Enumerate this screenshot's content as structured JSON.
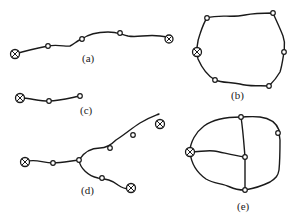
{
  "figure": {
    "width": 297,
    "height": 222,
    "colors": {
      "line": "#1a1a1a",
      "background": "#ffffff",
      "node_fill": "#ffffff"
    },
    "legend_symbols": {
      "source": "circled-x-icon",
      "node": "small-open-circle-icon"
    },
    "subfigures": [
      {
        "id": "a",
        "label": "(a)",
        "topology": "radial line",
        "sources": 2,
        "nodes": 4
      },
      {
        "id": "b",
        "label": "(b)",
        "topology": "ring / loop",
        "sources": 1,
        "nodes": 5
      },
      {
        "id": "c",
        "label": "(c)",
        "topology": "short radial line",
        "sources": 1,
        "nodes": 2
      },
      {
        "id": "d",
        "label": "(d)",
        "topology": "tree / branched",
        "sources": 3,
        "nodes": 4
      },
      {
        "id": "e",
        "label": "(e)",
        "topology": "mesh",
        "sources": 1,
        "nodes": 4
      }
    ]
  }
}
